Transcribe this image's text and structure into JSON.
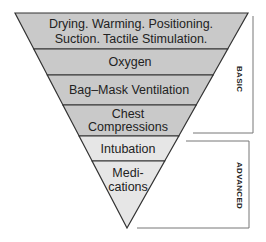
{
  "diagram": {
    "type": "inverted-pyramid",
    "colors": {
      "basic_fill": "#c9c9c9",
      "advanced_fill": "#e6e6e6",
      "outline": "#333333",
      "bracket": "#777777",
      "text": "#222222"
    },
    "bands": [
      {
        "lines": [
          "Drying. Warming. Positioning.",
          "Suction. Tactile Stimulation."
        ],
        "group": "basic"
      },
      {
        "lines": [
          "Oxygen"
        ],
        "group": "basic"
      },
      {
        "lines": [
          "Bag–Mask Ventilation"
        ],
        "group": "basic"
      },
      {
        "lines": [
          "Chest",
          "Compressions"
        ],
        "group": "basic"
      },
      {
        "lines": [
          "Intubation"
        ],
        "group": "advanced"
      },
      {
        "lines": [
          "Medi-",
          "cations"
        ],
        "group": "advanced"
      }
    ],
    "brackets": {
      "basic": {
        "label": "BASIC"
      },
      "advanced": {
        "label": "ADVANCED"
      }
    }
  }
}
